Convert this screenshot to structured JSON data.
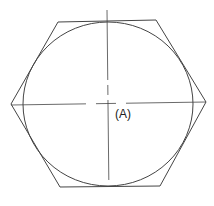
{
  "diagram": {
    "label": "(A)",
    "stroke_color": "#444444",
    "shapes": [
      "hexagon",
      "inscribed-circle",
      "center-lines"
    ]
  }
}
